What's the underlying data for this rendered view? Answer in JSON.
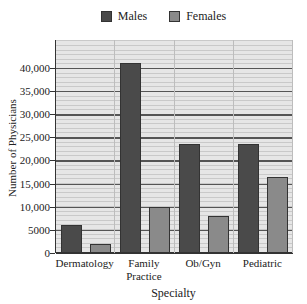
{
  "chart_data": {
    "type": "bar",
    "title": "",
    "xlabel": "Specialty",
    "ylabel": "Number of Physicians",
    "categories": [
      "Dermatology",
      "Family Practice",
      "Ob/Gyn",
      "Pediatric"
    ],
    "category_labels": [
      [
        "Dermatology"
      ],
      [
        "Family",
        "Practice"
      ],
      [
        "Ob/Gyn"
      ],
      [
        "Pediatric"
      ]
    ],
    "series": [
      {
        "name": "Males",
        "color": "#4a4a4a",
        "values": [
          6000,
          41000,
          23500,
          23500
        ]
      },
      {
        "name": "Females",
        "color": "#8a8a8a",
        "values": [
          2000,
          10000,
          8000,
          16500
        ]
      }
    ],
    "ylim": [
      0,
      46000
    ],
    "yticks": [
      0,
      5000,
      10000,
      15000,
      20000,
      25000,
      30000,
      35000,
      40000
    ],
    "ytick_labels": [
      "0",
      "5000",
      "10,000",
      "15,000",
      "20,000",
      "25,000",
      "30,000",
      "35,000",
      "40,000"
    ],
    "grid": true,
    "legend_position": "top"
  },
  "legend": [
    {
      "label": "Males",
      "color": "#4a4a4a"
    },
    {
      "label": "Females",
      "color": "#8a8a8a"
    }
  ]
}
